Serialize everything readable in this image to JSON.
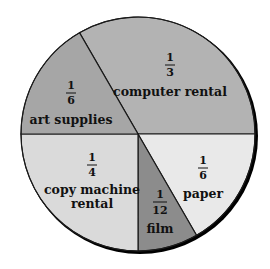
{
  "chart_data": {
    "type": "pie",
    "title": "",
    "start_angle_deg": 240,
    "direction": "clockwise",
    "slices": [
      {
        "label": "computer rental",
        "fraction": "1/3",
        "numerator": "1",
        "denominator": "3",
        "value": 0.3333,
        "color": "#b3b3b3",
        "label_lines": [
          "computer rental"
        ]
      },
      {
        "label": "paper",
        "fraction": "1/6",
        "numerator": "1",
        "denominator": "6",
        "value": 0.1667,
        "color": "#e9e9e9",
        "label_lines": [
          "paper"
        ]
      },
      {
        "label": "film",
        "fraction": "1/12",
        "numerator": "1",
        "denominator": "12",
        "value": 0.0833,
        "color": "#8c8c8c",
        "label_lines": [
          "film"
        ]
      },
      {
        "label": "copy machine rental",
        "fraction": "1/4",
        "numerator": "1",
        "denominator": "4",
        "value": 0.25,
        "color": "#dadada",
        "label_lines": [
          "copy machine",
          "rental"
        ]
      },
      {
        "label": "art supplies",
        "fraction": "1/6",
        "numerator": "1",
        "denominator": "6",
        "value": 0.1667,
        "color": "#a6a6a6",
        "label_lines": [
          "art supplies"
        ]
      }
    ],
    "legend": "none",
    "labels_inside": true
  }
}
